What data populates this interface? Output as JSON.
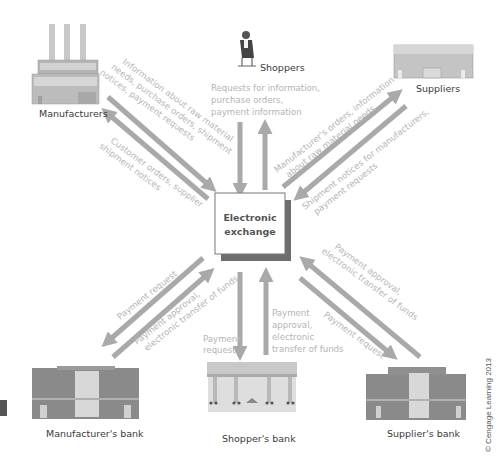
{
  "diagram": {
    "hub": {
      "line1": "Electronic",
      "line2": "exchange"
    },
    "nodes": {
      "manufacturers": "Manufacturers",
      "shoppers": "Shoppers",
      "suppliers": "Suppliers",
      "manufacturers_bank": "Manufacturer's  bank",
      "shoppers_bank": "Shopper's  bank",
      "suppliers_bank": "Supplier's bank"
    },
    "flows": {
      "manufacturers_to_exchange": [
        "Information about raw material",
        "needs, purchase orders, shipment",
        "notices, payment requests"
      ],
      "exchange_to_manufacturers": [
        "Customer orders, supplier",
        "shipment notices"
      ],
      "shoppers": [
        "Requests for information,",
        "purchase orders,",
        "payment information"
      ],
      "exchange_to_suppliers": [
        "Manufacturer's orders, information",
        "about raw material needs"
      ],
      "suppliers_to_exchange": [
        "Shipment notices for manufacturers,",
        "payment requests"
      ],
      "exchange_to_manufacturers_bank": [
        "Payment request"
      ],
      "manufacturers_bank_to_exchange": [
        "Payment approval,",
        "electronic transfer of funds"
      ],
      "exchange_to_shoppers_bank": [
        "Payment",
        "request"
      ],
      "shoppers_bank_to_exchange": [
        "Payment",
        "approval,",
        "electronic",
        "transfer of funds"
      ],
      "suppliers_bank_to_exchange": [
        "Payment approval,",
        "electronic transfer of funds"
      ],
      "exchange_to_suppliers_bank": [
        "Payment request"
      ]
    },
    "credit": "© Cengage Learning 2013",
    "colors": {
      "arrow": "#a9a9a9",
      "flow_text": "#b4b4b4",
      "label_text": "#3a3a3a",
      "hub_shadow": "#6e6e6e",
      "hub_border": "#777777",
      "building_brick": "#8a8a8a",
      "side_marker": "#555555"
    }
  }
}
